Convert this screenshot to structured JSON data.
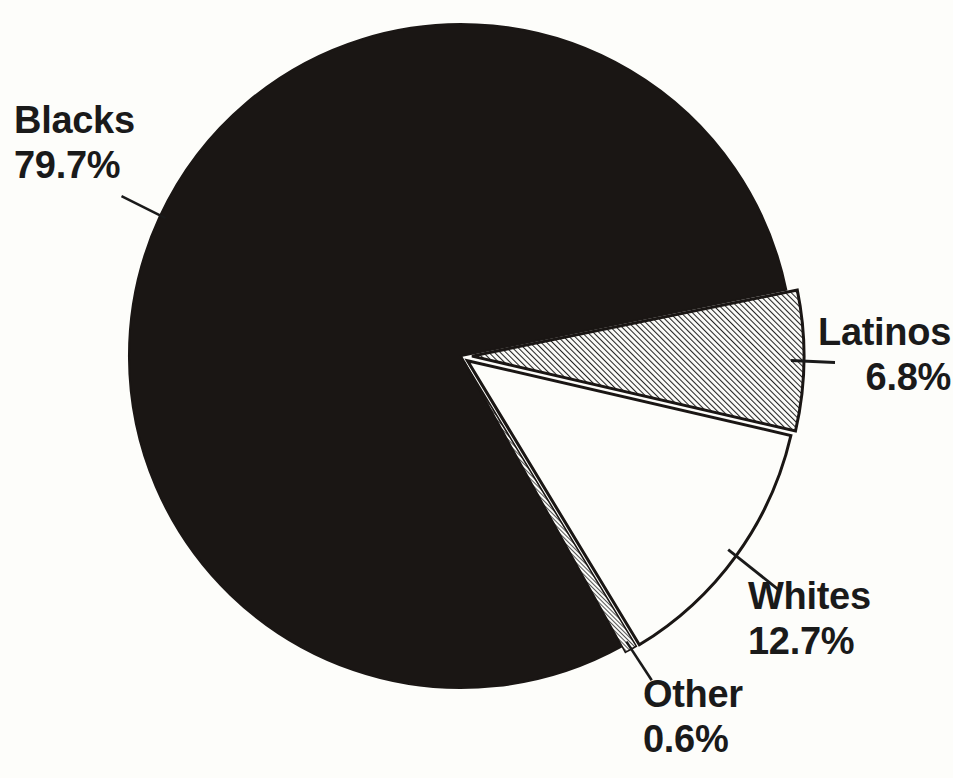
{
  "page": {
    "background_color": "#fdfdfa",
    "ink_color": "#1a1a1a"
  },
  "chart_data": {
    "type": "pie",
    "title": "",
    "subtitle": "",
    "xlabel": "",
    "ylabel": "",
    "legend_position": "none",
    "grid": false,
    "labels_on_slices": false,
    "label_style": "callout labels with leader lines",
    "categories": [
      "Blacks",
      "Latinos",
      "Whites",
      "Other"
    ],
    "values": [
      79.7,
      6.8,
      12.7,
      0.6
    ],
    "value_unit": "%",
    "total": 99.8,
    "slices": [
      {
        "name": "Blacks",
        "value": 79.7,
        "value_text": "79.7%",
        "label_text": "Blacks",
        "fill": "solid-black",
        "fill_color": "#1a1614",
        "start_angle_deg": 349,
        "end_angle_deg": 636
      },
      {
        "name": "Latinos",
        "value": 6.8,
        "value_text": "6.8%",
        "label_text": "Latinos",
        "fill": "diagonal-hatch",
        "fill_color": "#808080",
        "start_angle_deg": 349,
        "end_angle_deg": 373
      },
      {
        "name": "Whites",
        "value": 12.7,
        "value_text": "12.7%",
        "label_text": "Whites",
        "fill": "white",
        "fill_color": "#fdfdfa",
        "start_angle_deg": 373,
        "end_angle_deg": 419
      },
      {
        "name": "Other",
        "value": 0.6,
        "value_text": "0.6%",
        "label_text": "Other",
        "fill": "diagonal-hatch",
        "fill_color": "#808080",
        "start_angle_deg": 419,
        "end_angle_deg": 421
      }
    ],
    "geometry": {
      "center_x": 461,
      "center_y": 356,
      "radius": 332
    }
  },
  "labels": {
    "blacks": {
      "name": "Blacks",
      "value": "79.7%"
    },
    "latinos": {
      "name": "Latinos",
      "value": "6.8%"
    },
    "whites": {
      "name": "Whites",
      "value": "12.7%"
    },
    "other": {
      "name": "Other",
      "value": "0.6%"
    }
  }
}
